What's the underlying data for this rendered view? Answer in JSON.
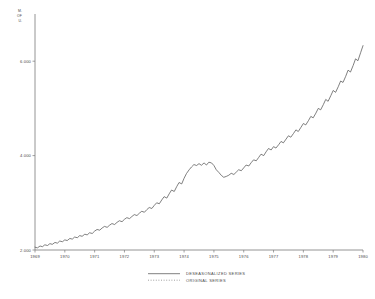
{
  "chart_data": {
    "type": "line",
    "title": "",
    "subtitle": "",
    "xlabel": "",
    "ylabel": "",
    "corner_unit_label": "M.\nOF\nU.",
    "grid": false,
    "legend_position": "bottom-center",
    "xlim": [
      1969,
      1980
    ],
    "ylim": [
      2000,
      7000
    ],
    "x_ticks": [
      1969,
      1970,
      1971,
      1972,
      1973,
      1974,
      1975,
      1976,
      1977,
      1978,
      1979,
      1980
    ],
    "x_tick_labels": [
      "1969",
      "1970",
      "1971",
      "1972",
      "1973",
      "1974",
      "1975",
      "1976",
      "1977",
      "1978",
      "1979",
      "1980"
    ],
    "y_ticks": [
      2000,
      4000,
      6000
    ],
    "y_tick_labels": [
      "2.000",
      "4.000",
      "6.000"
    ],
    "series": [
      {
        "name": "DESEASONALIZED SERIES",
        "style": "solid",
        "color": "#555555",
        "x": [
          1969.0,
          1969.08,
          1969.17,
          1969.25,
          1969.33,
          1969.42,
          1969.5,
          1969.58,
          1969.67,
          1969.75,
          1969.83,
          1969.92,
          1970.0,
          1970.08,
          1970.17,
          1970.25,
          1970.33,
          1970.42,
          1970.5,
          1970.58,
          1970.67,
          1970.75,
          1970.83,
          1970.92,
          1971.0,
          1971.08,
          1971.17,
          1971.25,
          1971.33,
          1971.42,
          1971.5,
          1971.58,
          1971.67,
          1971.75,
          1971.83,
          1971.92,
          1972.0,
          1972.08,
          1972.17,
          1972.25,
          1972.33,
          1972.42,
          1972.5,
          1972.58,
          1972.67,
          1972.75,
          1972.83,
          1972.92,
          1973.0,
          1973.08,
          1973.17,
          1973.25,
          1973.33,
          1973.42,
          1973.5,
          1973.58,
          1973.67,
          1973.75,
          1973.83,
          1973.92,
          1974.0,
          1974.08,
          1974.17,
          1974.25,
          1974.33,
          1974.42,
          1974.5,
          1974.58,
          1974.67,
          1974.75,
          1974.83,
          1974.92,
          1975.0,
          1975.08,
          1975.17,
          1975.25,
          1975.33,
          1975.42,
          1975.5,
          1975.58,
          1975.67,
          1975.75,
          1975.83,
          1975.92,
          1976.0,
          1976.08,
          1976.17,
          1976.25,
          1976.33,
          1976.42,
          1976.5,
          1976.58,
          1976.67,
          1976.75,
          1976.83,
          1976.92,
          1977.0,
          1977.08,
          1977.17,
          1977.25,
          1977.33,
          1977.42,
          1977.5,
          1977.58,
          1977.67,
          1977.75,
          1977.83,
          1977.92,
          1978.0,
          1978.08,
          1978.17,
          1978.25,
          1978.33,
          1978.42,
          1978.5,
          1978.58,
          1978.67,
          1978.75,
          1978.83,
          1978.92,
          1979.0,
          1979.08,
          1979.17,
          1979.25,
          1979.33,
          1979.42,
          1979.5,
          1979.58,
          1979.67,
          1979.75,
          1979.83,
          1979.92,
          1980.0
        ],
        "y": [
          2060,
          2045,
          2085,
          2070,
          2110,
          2095,
          2135,
          2120,
          2160,
          2145,
          2190,
          2175,
          2215,
          2200,
          2245,
          2230,
          2275,
          2260,
          2305,
          2290,
          2335,
          2320,
          2365,
          2350,
          2400,
          2435,
          2420,
          2465,
          2500,
          2480,
          2525,
          2560,
          2540,
          2585,
          2620,
          2600,
          2650,
          2685,
          2665,
          2710,
          2750,
          2730,
          2780,
          2820,
          2800,
          2855,
          2900,
          2880,
          2945,
          3000,
          2980,
          3060,
          3130,
          3100,
          3190,
          3270,
          3240,
          3340,
          3430,
          3400,
          3520,
          3620,
          3700,
          3760,
          3810,
          3790,
          3830,
          3795,
          3845,
          3800,
          3860,
          3845,
          3790,
          3700,
          3640,
          3580,
          3540,
          3560,
          3585,
          3625,
          3600,
          3650,
          3700,
          3680,
          3740,
          3800,
          3780,
          3850,
          3910,
          3890,
          3960,
          4030,
          4000,
          4080,
          4150,
          4120,
          4190,
          4160,
          4230,
          4300,
          4270,
          4350,
          4420,
          4390,
          4470,
          4545,
          4510,
          4600,
          4680,
          4650,
          4740,
          4830,
          4800,
          4900,
          5000,
          4970,
          5080,
          5190,
          5150,
          5270,
          5380,
          5340,
          5460,
          5580,
          5550,
          5680,
          5810,
          5770,
          5910,
          6050,
          6010,
          6180,
          6330
        ]
      },
      {
        "name": "ORIGINAL SERIES",
        "style": "dotted",
        "color": "#777777",
        "x": [],
        "y": []
      }
    ],
    "legend": [
      {
        "label": "DESEASONALIZED SERIES",
        "style": "solid"
      },
      {
        "label": "ORIGINAL SERIES",
        "style": "dotted"
      }
    ]
  },
  "corner": {
    "line1": "M.",
    "line2": "OF",
    "line3": "U."
  }
}
